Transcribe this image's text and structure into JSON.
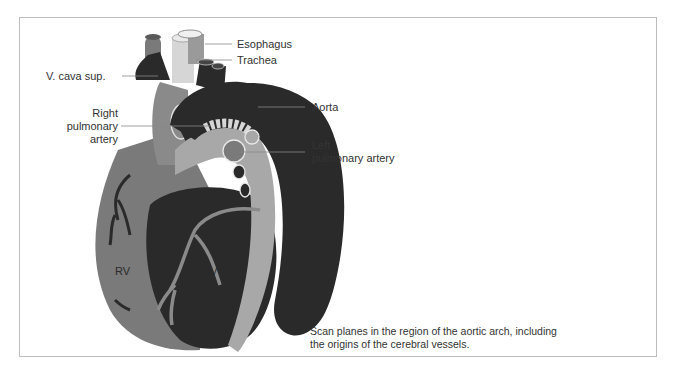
{
  "figure": {
    "top_text_cut": "ccurately ... the recording ... supply ... anterior ...",
    "labels": {
      "esophagus": "Esophagus",
      "trachea": "Trachea",
      "v_cava_sup": "V. cava sup.",
      "right_pulmonary_artery": [
        "Right",
        "pulmonary",
        "artery"
      ],
      "aorta": "Aorta",
      "left_pulmonary_artery": [
        "Left",
        "pulmonary artery"
      ],
      "la": "LA",
      "rv": "RV",
      "lv": "LV"
    },
    "caption": [
      "Scan planes in the region of the aortic arch, including",
      "the origins of the cerebral vessels."
    ],
    "colors": {
      "dark": "#2a2a2a",
      "mid_gray": "#7a7a7a",
      "light_gray": "#a8a8a8",
      "pale": "#d6d6d6",
      "frame": "#bdbdbd",
      "leader": "#888888"
    }
  }
}
